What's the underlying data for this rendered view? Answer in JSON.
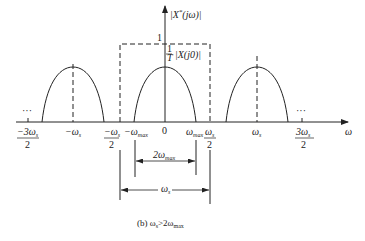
{
  "figure": {
    "caption": "(b) ωs>2ωmax",
    "caption_parts": {
      "prefix": "(b) ω",
      "s_sub": "s",
      "mid": ">2ω",
      "max_sub": "max"
    }
  },
  "axes": {
    "y_axis_label": "|X*(jω)|",
    "y_axis_label_parts": {
      "open": "|X",
      "star": "*",
      "rest": "(jω)|"
    },
    "x_axis_label": "ω",
    "y_tick_one": "1",
    "center_label": {
      "frac_num": "1",
      "frac_den": "T",
      "text": "|X(j0)|"
    }
  },
  "x_ticks": [
    {
      "id": "neg-3ws-over-2",
      "main": "−3ω",
      "sub": "s",
      "den": "2"
    },
    {
      "id": "neg-ws",
      "main": "−ω",
      "sub": "s"
    },
    {
      "id": "neg-ws-over-2",
      "main": "−ω",
      "sub": "s",
      "den": "2"
    },
    {
      "id": "neg-wmax",
      "main": "−ω",
      "sub": "max"
    },
    {
      "id": "zero",
      "main": "0"
    },
    {
      "id": "wmax",
      "main": "ω",
      "sub": "max"
    },
    {
      "id": "ws-over-2",
      "main": "ω",
      "sub": "s",
      "den": "2"
    },
    {
      "id": "ws",
      "main": "ω",
      "sub": "s"
    },
    {
      "id": "3ws-over-2",
      "main": "3ω",
      "sub": "s",
      "den": "2"
    }
  ],
  "ellipsis": "···",
  "dimensions": {
    "inner": {
      "main": "2ω",
      "sub": "max"
    },
    "outer": {
      "main": "ω",
      "sub": "s"
    }
  },
  "colors": {
    "line": "#222222",
    "background": "#ffffff"
  }
}
